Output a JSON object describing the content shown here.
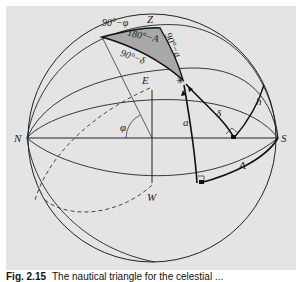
{
  "figure": {
    "caption_number": "Fig. 2.15",
    "caption_text": "The nautical triangle for the celestial ...",
    "background_color": "#e4e4e4",
    "shaded_triangle_color": "#a8a8a8",
    "line_color": "#222222"
  },
  "labels": {
    "zenith": "Z",
    "north": "N",
    "south": "S",
    "east": "E",
    "west": "W",
    "colatitude": "90°−φ",
    "hour_angle_supplement": "180°−A",
    "codeclination": "90°−δ",
    "coaltitude": "90°−a",
    "latitude": "φ",
    "altitude": "a",
    "declination": "δ",
    "hour_angle": "h",
    "azimuth": "A",
    "star_marker": "✳"
  }
}
